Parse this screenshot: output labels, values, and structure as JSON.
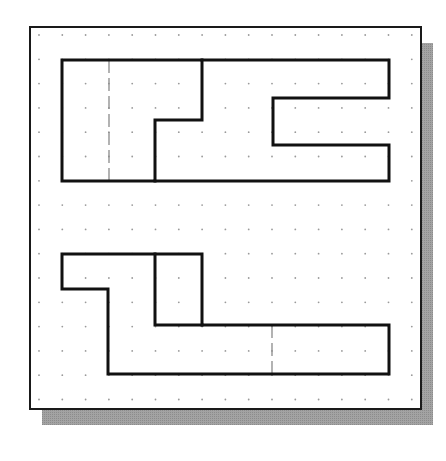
{
  "canvas": {
    "width": 446,
    "height": 461,
    "background": "#ffffff"
  },
  "colors": {
    "frame_stroke": "#1a1a1a",
    "frame_fill": "#ffffff",
    "shadow": "#a3a3a3",
    "grid_dot": "#9a9a9a",
    "object_line": "#111111",
    "hidden_line": "#8a8a8a"
  },
  "frame": {
    "x": 30,
    "y": 27,
    "width": 391,
    "height": 382,
    "stroke_width": 2,
    "shadow": {
      "dx": 12,
      "dy": 16
    }
  },
  "grid": {
    "origin_x": 39,
    "origin_y": 35,
    "spacing_x": 23.3,
    "spacing_y": 24.3,
    "cols": 17,
    "rows": 16,
    "dot_radius": 0.9
  },
  "views": [
    {
      "name": "top-view",
      "outline": [
        [
          62,
          60
        ],
        [
          202,
          60
        ],
        [
          202,
          120
        ],
        [
          155,
          120
        ],
        [
          155,
          181
        ],
        [
          62,
          181
        ],
        [
          62,
          60
        ]
      ],
      "outline_right": [
        [
          202,
          60
        ],
        [
          389,
          60
        ],
        [
          389,
          98
        ],
        [
          273,
          98
        ],
        [
          273,
          145
        ],
        [
          389,
          145
        ],
        [
          389,
          181
        ],
        [
          155,
          181
        ]
      ],
      "hidden_lines": [
        [
          [
            109,
            60
          ],
          [
            109,
            181
          ]
        ]
      ],
      "stroke_width": 3
    },
    {
      "name": "front-view",
      "outline": [
        [
          62,
          254
        ],
        [
          202,
          254
        ],
        [
          202,
          325
        ],
        [
          389,
          325
        ],
        [
          389,
          374
        ],
        [
          108,
          374
        ],
        [
          108,
          289
        ],
        [
          62,
          289
        ],
        [
          62,
          254
        ]
      ],
      "inner_lines": [
        [
          [
            155,
            254
          ],
          [
            155,
            325
          ],
          [
            202,
            325
          ]
        ]
      ],
      "hidden_lines": [
        [
          [
            272,
            325
          ],
          [
            272,
            374
          ]
        ]
      ],
      "stroke_width": 3
    }
  ]
}
